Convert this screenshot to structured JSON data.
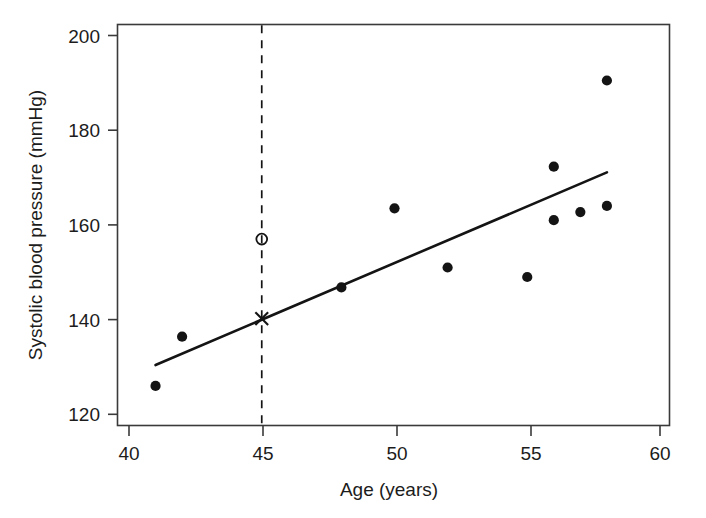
{
  "chart_data": {
    "type": "scatter",
    "title": "",
    "xlabel": "Age (years)",
    "ylabel": "Systolic blood pressure (mmHg)",
    "xlim": [
      40,
      60
    ],
    "ylim": [
      118.5,
      202
    ],
    "xticks": [
      40,
      45,
      50,
      55,
      60
    ],
    "xtick_labels": [
      "40",
      "45",
      "50",
      "55",
      "60"
    ],
    "yticks": [
      120,
      140,
      160,
      180,
      200
    ],
    "ytick_labels": [
      "120",
      "140",
      "160",
      "180",
      "200"
    ],
    "grid": false,
    "legend": "none",
    "series": [
      {
        "name": "observed data",
        "marker": "filled-circle",
        "color": "#141414",
        "x": [
          41,
          42,
          48,
          50,
          52,
          55,
          56,
          56,
          57,
          58,
          58
        ],
        "y": [
          126,
          136.4,
          146.8,
          163.5,
          151,
          149,
          172.3,
          161,
          162.7,
          164,
          190.5
        ]
      },
      {
        "name": "predicted value at age 45",
        "marker": "cross",
        "color": "#141414",
        "x": [
          45
        ],
        "y": [
          140.2
        ]
      },
      {
        "name": "observed value at age 45",
        "marker": "open-circle",
        "color": "#141414",
        "x": [
          45
        ],
        "y": [
          157
        ]
      }
    ],
    "lines": [
      {
        "name": "regression-line",
        "style": "solid",
        "color": "#141414",
        "x": [
          41,
          58
        ],
        "y": [
          130.4,
          171.1
        ]
      },
      {
        "name": "reference-line-age-45",
        "style": "dashed",
        "color": "#141414",
        "orientation": "vertical",
        "x": 45
      }
    ]
  },
  "axes": {
    "x_label": "Age (years)",
    "y_label": "Systolic blood pressure (mmHg)",
    "x_tick_labels": [
      "40",
      "45",
      "50",
      "55",
      "60"
    ],
    "y_tick_labels": [
      "120",
      "140",
      "160",
      "180",
      "200"
    ]
  },
  "colors": {
    "background": "#ffffff",
    "foreground": "#141414",
    "axis": "#3a3a3a"
  }
}
